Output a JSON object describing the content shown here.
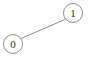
{
  "diagram": {
    "type": "undirected-graph",
    "width": 92,
    "height": 59,
    "background_color": "#ffffff",
    "stroke_color": "#8d8d8d",
    "label_color": "#2b2b2b",
    "nodes": [
      {
        "id": "0",
        "label": "0",
        "cx": 13,
        "cy": 44,
        "r": 9.5
      },
      {
        "id": "1",
        "label": "1",
        "cx": 73,
        "cy": 13,
        "r": 9.5
      }
    ],
    "edges": [
      {
        "id": "e0",
        "source": "0",
        "target": "1",
        "x1": 21.2,
        "y1": 38.4,
        "x2": 65.6,
        "y2": 19.2
      }
    ]
  }
}
